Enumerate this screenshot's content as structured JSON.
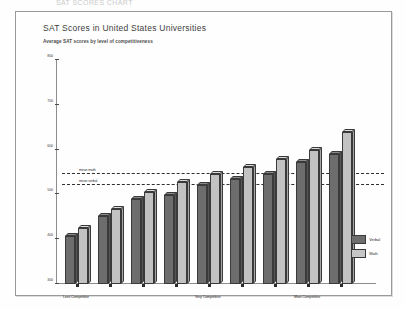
{
  "top_strip_text": "SAT SCORES CHART",
  "card": {
    "title": "SAT Scores in United States Universities",
    "subtitle": "Average SAT scores by level of competitiveness"
  },
  "legend": {
    "items": [
      {
        "label": "Verbal",
        "color": "#6d6d6d"
      },
      {
        "label": "Math",
        "color": "#c6c6c6"
      }
    ]
  },
  "reference_lines": [
    {
      "label": "mean math",
      "value": 545
    },
    {
      "label": "mean verbal",
      "value": 522
    }
  ],
  "chart_data": {
    "type": "bar",
    "title": "SAT Scores in United States Universities",
    "subtitle": "Average SAT scores by level of competitiveness",
    "xlabel": "",
    "ylabel": "",
    "ylim": [
      300,
      800
    ],
    "yticks": [
      300,
      400,
      500,
      600,
      700,
      800
    ],
    "ytick_labels": [
      "300",
      "400",
      "500",
      "600",
      "700",
      "800"
    ],
    "grid": false,
    "legend_position": "bottom-right",
    "categories": [
      "Less Competitive",
      "",
      "",
      "",
      "Very Competitive",
      "",
      "",
      "Most Competitive",
      ""
    ],
    "visible_xtick_labels": [
      {
        "index": 0,
        "label": "Less Competitive"
      },
      {
        "index": 4,
        "label": "Very Competitive"
      },
      {
        "index": 7,
        "label": "Most Competitive"
      }
    ],
    "series": [
      {
        "name": "Verbal",
        "color": "#6d6d6d",
        "values": [
          408,
          452,
          490,
          498,
          520,
          535,
          545,
          572,
          590
        ]
      },
      {
        "name": "Math",
        "color": "#c6c6c6",
        "values": [
          425,
          468,
          505,
          528,
          545,
          562,
          580,
          600,
          640
        ]
      }
    ],
    "reference_lines": [
      {
        "label": "mean math",
        "value": 545,
        "style": "dashed"
      },
      {
        "label": "mean verbal",
        "value": 522,
        "style": "dashed"
      }
    ]
  }
}
